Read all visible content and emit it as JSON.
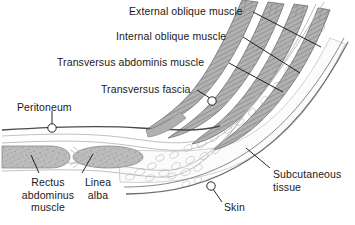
{
  "figure": {
    "background_color": "#ffffff",
    "colors": {
      "muscle_fill": "#b5b5b5",
      "muscle_stroke": "#6e6e6e",
      "outline": "#9a9a9a",
      "peritoneum_line": "#4a4a4a",
      "skin_line": "#707070",
      "fat_cell": "#cccccc",
      "leader_line": "#111111",
      "text": "#1a1a1a"
    }
  },
  "labels": {
    "external_oblique": {
      "text": "External oblique muscle",
      "x": 129,
      "y": 5,
      "align": "left"
    },
    "internal_oblique": {
      "text": "Internal oblique muscle",
      "x": 116,
      "y": 30,
      "align": "left"
    },
    "transversus_abdominis": {
      "text": "Transversus abdominis muscle",
      "x": 57,
      "y": 56,
      "align": "left"
    },
    "transversus_fascia": {
      "text": "Transversus fascia",
      "x": 101,
      "y": 83,
      "align": "left"
    },
    "peritoneum": {
      "text": "Peritoneum",
      "x": 17,
      "y": 101,
      "align": "left"
    },
    "rectus_abdominus": {
      "text": "Rectus\nabdominus\nmuscle",
      "x": 8,
      "y": 176,
      "align": "center"
    },
    "linea_alba": {
      "text": "Linea\nalba",
      "x": 75,
      "y": 176,
      "align": "center"
    },
    "subcutaneous_tissue": {
      "text": "Subcutaneous\ntissue",
      "x": 273,
      "y": 168,
      "align": "left"
    },
    "skin": {
      "text": "Skin",
      "x": 224,
      "y": 201,
      "align": "left"
    }
  },
  "structures": [
    {
      "name": "external-oblique-muscle",
      "layer": 1
    },
    {
      "name": "internal-oblique-muscle",
      "layer": 2
    },
    {
      "name": "transversus-abdominis-muscle",
      "layer": 3
    },
    {
      "name": "transversus-fascia",
      "layer": 4
    },
    {
      "name": "peritoneum",
      "layer": 5
    },
    {
      "name": "rectus-abdominus-muscle",
      "layer": 6
    },
    {
      "name": "linea-alba",
      "layer": 7
    },
    {
      "name": "subcutaneous-tissue",
      "layer": 8
    },
    {
      "name": "skin",
      "layer": 9
    }
  ]
}
